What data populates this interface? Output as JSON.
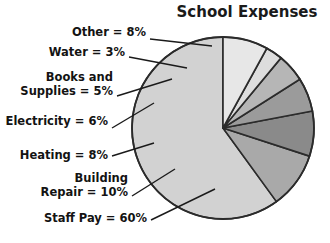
{
  "chart_data": {
    "type": "pie",
    "title": "School Expenses",
    "xlabel": "",
    "ylabel": "",
    "legend_position": "outside-left",
    "grid": false,
    "start_angle_deg": 90,
    "direction": "counterclockwise",
    "categories": [
      "Staff Pay",
      "Building Repair",
      "Heating",
      "Electricity",
      "Books and Supplies",
      "Water",
      "Other"
    ],
    "values": [
      60,
      10,
      8,
      6,
      5,
      3,
      8
    ],
    "value_unit": "%",
    "colors": [
      "#d2d2d2",
      "#a9a9a9",
      "#8a8a8a",
      "#9b9b9b",
      "#b6b6b6",
      "#dddddd",
      "#e7e7e7"
    ],
    "slice_border_color": "#2b2b2b",
    "labels": [
      {
        "key": "other",
        "line1": "Other = 8%",
        "line2": ""
      },
      {
        "key": "water",
        "line1": "Water = 3%",
        "line2": ""
      },
      {
        "key": "books",
        "line1": "Books and",
        "line2": "Supplies = 5%"
      },
      {
        "key": "electric",
        "line1": "Electricity = 6%",
        "line2": ""
      },
      {
        "key": "heating",
        "line1": "Heating = 8%",
        "line2": ""
      },
      {
        "key": "building",
        "line1": "Building",
        "line2": "Repair = 10%"
      },
      {
        "key": "staffpay",
        "line1": "Staff Pay = 60%",
        "line2": ""
      }
    ]
  }
}
